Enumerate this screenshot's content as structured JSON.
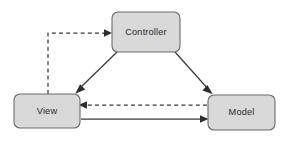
{
  "diagram": {
    "background_color": "#ffffff",
    "node_fill_color": "#d9d9d9",
    "node_stroke_color": "#6b6b6b",
    "edge_color": "#3a3a3a",
    "label_color": "#2a2a2a",
    "nodes": [
      {
        "id": "controller",
        "label": "Controller",
        "x": 112,
        "y": 12,
        "width": 68,
        "height": 40,
        "radius": 6,
        "cx": 146,
        "cy": 32
      },
      {
        "id": "view",
        "label": "View",
        "x": 14,
        "y": 94,
        "width": 66,
        "height": 34,
        "radius": 6,
        "cx": 47,
        "cy": 111
      },
      {
        "id": "model",
        "label": "Model",
        "x": 208,
        "y": 95,
        "width": 67,
        "height": 35,
        "radius": 6,
        "cx": 241,
        "cy": 112
      }
    ],
    "edges": [
      {
        "id": "view-to-controller",
        "from": "View",
        "to": "Controller",
        "style": "dashed",
        "path": "M 48 94 L 48 33 L 107 33",
        "arrow_at": {
          "x": 111,
          "y": 33,
          "direction": "right"
        }
      },
      {
        "id": "controller-to-view",
        "from": "Controller",
        "to": "View",
        "style": "solid",
        "path": "M 117 52 L 79 89",
        "arrow_at": {
          "x": 76,
          "y": 93,
          "direction": "down-left"
        }
      },
      {
        "id": "controller-to-model",
        "from": "Controller",
        "to": "Model",
        "style": "solid",
        "path": "M 175 52 L 209 90",
        "arrow_at": {
          "x": 212,
          "y": 93,
          "direction": "down-right"
        }
      },
      {
        "id": "model-to-view",
        "from": "Model",
        "to": "View",
        "style": "dashed",
        "path": "M 207 105 L 83 105",
        "arrow_at": {
          "x": 79,
          "y": 105,
          "direction": "left"
        }
      },
      {
        "id": "view-to-model",
        "from": "View",
        "to": "Model",
        "style": "solid",
        "path": "M 81 119 L 204 119",
        "arrow_at": {
          "x": 208,
          "y": 119,
          "direction": "right"
        }
      }
    ]
  }
}
